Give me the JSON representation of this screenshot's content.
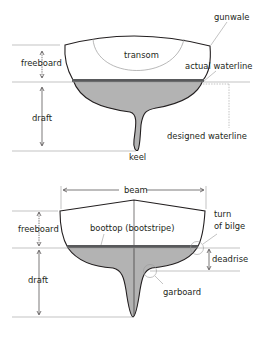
{
  "diagram_top": {
    "labels": {
      "gunwale": "gunwale",
      "transom": "transom",
      "freeboard": "freeboard",
      "actual_waterline": "actual waterline",
      "draft": "draft",
      "designed_waterline": "designed waterline",
      "keel": "keel"
    }
  },
  "diagram_bottom": {
    "labels": {
      "beam": "beam",
      "turn_of_bilge_line1": "turn",
      "turn_of_bilge_line2": "of bilge",
      "freeboard": "freeboard",
      "boottop": "boottop (bootstripe)",
      "deadrise": "deadrise",
      "draft": "draft",
      "garboard": "garboard"
    }
  },
  "colors": {
    "underwater_fill": "#b3b3b3",
    "waterline_stripe": "#58595b",
    "outline": "#231f20",
    "leader": "#9a9a9a"
  }
}
